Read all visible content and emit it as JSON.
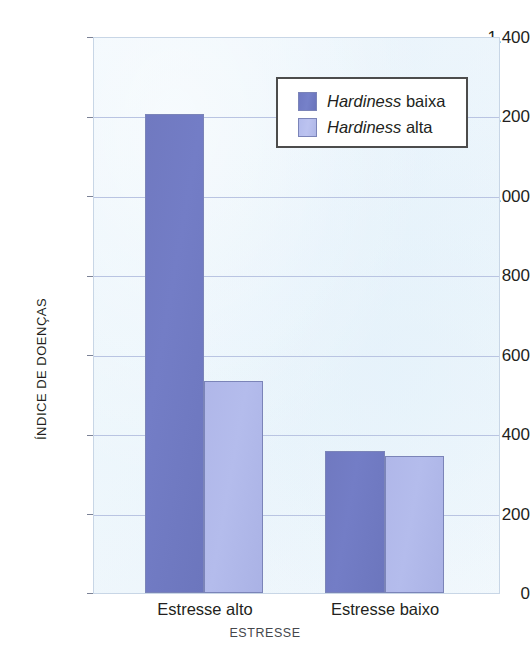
{
  "chart_data": {
    "type": "bar",
    "title": "",
    "subtitle": "",
    "xlabel": "ESTRESSE",
    "ylabel": "ÍNDICE DE DOENÇAS",
    "categories": [
      "Estresse alto",
      "Estresse baixo"
    ],
    "series": [
      {
        "name": "Hardiness baixa",
        "name_italic_part": "Hardiness",
        "name_plain_part": "baixa",
        "color": "#707ac0",
        "values": [
          1212,
          360
        ]
      },
      {
        "name": "Hardiness alta",
        "name_italic_part": "Hardiness",
        "name_plain_part": "alta",
        "color": "#b2bae9",
        "values": [
          536,
          347
        ]
      }
    ],
    "ylim": [
      0,
      1400
    ],
    "yticks": [
      0,
      200,
      400,
      600,
      800,
      1000,
      1200,
      1400
    ],
    "ytick_labels": [
      "0",
      "200",
      "400",
      "600",
      "800",
      "1.000",
      "1.200",
      "1.400"
    ],
    "grid": true,
    "grid_axis": "y",
    "legend_position": "top-right",
    "plot_background": "#ecf5fb",
    "grid_color": "#b9c4e2"
  },
  "axis": {
    "y_title": "ÍNDICE DE DOENÇAS",
    "x_title": "ESTRESSE"
  },
  "legend": {
    "entries": [
      {
        "italic": "Hardiness",
        "plain": "baixa"
      },
      {
        "italic": "Hardiness",
        "plain": "alta"
      }
    ]
  }
}
